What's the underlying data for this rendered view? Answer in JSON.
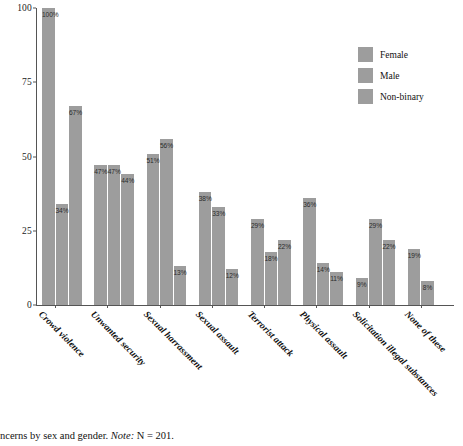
{
  "chart_data": {
    "type": "bar",
    "title": "",
    "xlabel": "",
    "ylabel": "",
    "ylim": [
      0,
      100
    ],
    "yticks": [
      0,
      25,
      50,
      75,
      100
    ],
    "grid": false,
    "legend_position": "top-right",
    "categories": [
      "Crowd violence",
      "Unwanted security",
      "Sexual harrassment",
      "Sexual assault",
      "Terrorist attack",
      "Physical assault",
      "Solicitation illegal substances",
      "None of these"
    ],
    "series": [
      {
        "name": "Female",
        "values": [
          100,
          47,
          51,
          38,
          29,
          36,
          9,
          19
        ]
      },
      {
        "name": "Male",
        "values": [
          34,
          47,
          56,
          33,
          18,
          14,
          29,
          8
        ]
      },
      {
        "name": "Non-binary",
        "values": [
          67,
          44,
          13,
          12,
          22,
          11,
          22,
          null
        ]
      }
    ],
    "value_labels": [
      [
        "100%",
        "34%",
        "67%"
      ],
      [
        "47%",
        "47%",
        "44%"
      ],
      [
        "51%",
        "56%",
        "13%"
      ],
      [
        "38%",
        "33%",
        "12%"
      ],
      [
        "29%",
        "18%",
        "22%"
      ],
      [
        "36%",
        "14%",
        "11%"
      ],
      [
        "9%",
        "29%",
        "22%"
      ],
      [
        "19%",
        "8%",
        ""
      ]
    ],
    "bar_color": "#9d9d9d",
    "axis_color": "#555555"
  },
  "legend": {
    "items": [
      {
        "label": "Female"
      },
      {
        "label": "Male"
      },
      {
        "label": "Non-binary"
      }
    ]
  },
  "caption": {
    "text": "ncerns by sex and gender. ",
    "note_label": "Note:",
    "note_value": " N = 201."
  }
}
